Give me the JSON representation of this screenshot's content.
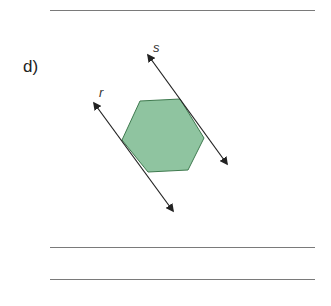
{
  "exercise": {
    "part_label": "d)"
  },
  "figure": {
    "shape": "regular hexagon",
    "fill_color": "#8fc4a0",
    "stroke_color": "#3f7a4f",
    "hexagon_points": "140,101 180,99 204,138 188,170 148,172 122,140",
    "lines": [
      {
        "name": "s",
        "label": "s",
        "x1": 148,
        "y1": 55,
        "x2": 227,
        "y2": 164,
        "label_x": 153,
        "label_y": 52
      },
      {
        "name": "r",
        "label": "r",
        "x1": 94,
        "y1": 103,
        "x2": 173,
        "y2": 211,
        "label_x": 99,
        "label_y": 97
      }
    ],
    "line_color": "#222222"
  },
  "answer_lines": [
    {
      "y": 10
    },
    {
      "y": 247
    },
    {
      "y": 279
    }
  ]
}
